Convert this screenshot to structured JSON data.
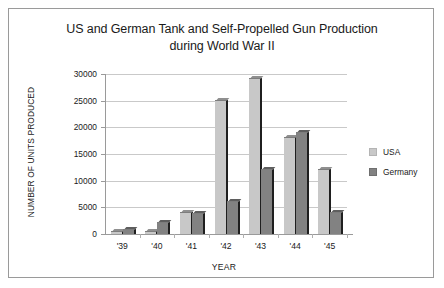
{
  "chart_data": {
    "type": "bar",
    "title": "US and German Tank and Self-Propelled Gun Production during World War II",
    "title_line1": "US and German Tank and Self-Propelled Gun Production",
    "title_line2": "during World War II",
    "xlabel": "YEAR",
    "ylabel": "NUMBER OF UNITS PRODUCED",
    "categories": [
      "'39",
      "'40",
      "'41",
      "'42",
      "'43",
      "'44",
      "'45"
    ],
    "series": [
      {
        "name": "USA",
        "color": "#c8c8c8",
        "values": [
          300,
          400,
          4000,
          25000,
          29000,
          18000,
          12000
        ]
      },
      {
        "name": "Germany",
        "color": "#828282",
        "values": [
          700,
          2000,
          3800,
          6000,
          12000,
          19000,
          4000
        ]
      }
    ],
    "ylim": [
      0,
      30000
    ],
    "yticks": [
      0,
      5000,
      10000,
      15000,
      20000,
      25000,
      30000
    ],
    "ytick_labels": [
      "0",
      "5000",
      "10000",
      "15000",
      "20000",
      "25000",
      "30000"
    ],
    "grid": true,
    "legend_position": "right"
  },
  "legend": {
    "entries": [
      {
        "label": "USA"
      },
      {
        "label": "Germany"
      }
    ]
  }
}
